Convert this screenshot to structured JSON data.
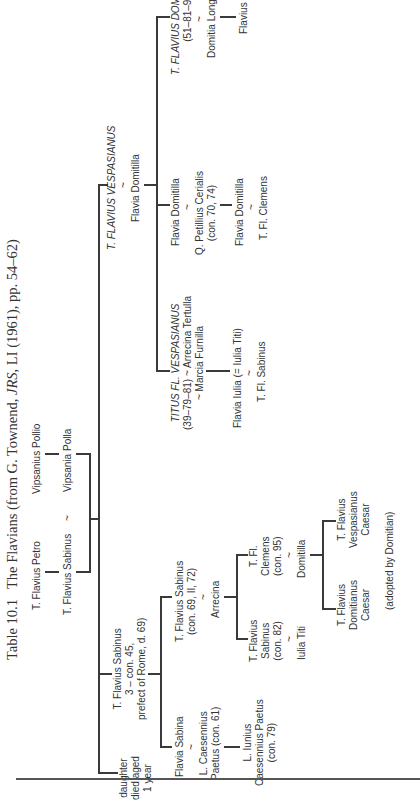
{
  "caption": {
    "number": "Table 10.1",
    "text_before": "The Flavians (from G. Townend, ",
    "journal": "JRS",
    "text_after": ", LI (1961), pp. 54–62)"
  },
  "tree": {
    "petro": "T. Flavius Petro",
    "pollio": "Vipsanius Pollio",
    "sabinus_sr": "T. Flavius Sabinus",
    "marriage_sym": "~",
    "vipsania": "Vipsania Polla",
    "daughter": [
      "daughter",
      "died aged",
      "1 year"
    ],
    "sabinus_prefect": [
      "T. Flavius Sabinus",
      "3 – con. 45,",
      "prefect of Rome, d. 69)"
    ],
    "vespasian": "T. FLAVIUS VESPASIANUS",
    "vespasian_wife": "Flavia Domitilla",
    "flavia_sabina": "Flavia Sabina",
    "caesennius_paetus": [
      "L. Caesennius",
      "Paetus (con. 61)"
    ],
    "iunius_paetus": [
      "L. Iunius",
      "Caesennius Paetus",
      "(con. 79)"
    ],
    "sabinus_con69": [
      "T. Flavius Sabinus",
      "(con. 69, II, 72)"
    ],
    "arrecina": "Arrecina",
    "sabinus_con82": [
      "T. Flavius",
      "Sabinus",
      "(con. 82)"
    ],
    "iulia_titi": "Iulia Titi",
    "clemens_con95": [
      "T. Fl.",
      "Clemens",
      "(con. 95)"
    ],
    "domitilla_clemens_wife": "Domitilla",
    "domitianus_caesar": [
      "T. Flavius",
      "Domitianus",
      "Caesar"
    ],
    "vespasianus_caesar": [
      "T. Flavius",
      "Vespasianus",
      "Caesar"
    ],
    "adopted_note": "(adopted by Domitian)",
    "titus": [
      "TITUS FL. VESPASIANUS",
      "(39–79–81) ~ Arrecina Tertulla",
      "~ Marcia Furnilla"
    ],
    "flavia_iulia": "Flavia Iulia (= Iulia Titi)",
    "fl_sabinus": "T. Fl. Sabinus",
    "domitilla_daughter": "Flavia Domitilla",
    "cerialis": [
      "Q. Petillius Cerialis",
      "(con. 70, 74)"
    ],
    "domitilla_granddaughter": "Flavia Domitilla",
    "fl_clemens": "T. Fl. Clemens",
    "domitian": [
      "T. FLAVIUS DOMITIANUS",
      "(51–81–96)"
    ],
    "domitia": "Domitia Longina",
    "flavius_son": "Flavius"
  },
  "colors": {
    "ink": "#333333",
    "lines": "#3a3a3a",
    "background": "#ffffff"
  }
}
